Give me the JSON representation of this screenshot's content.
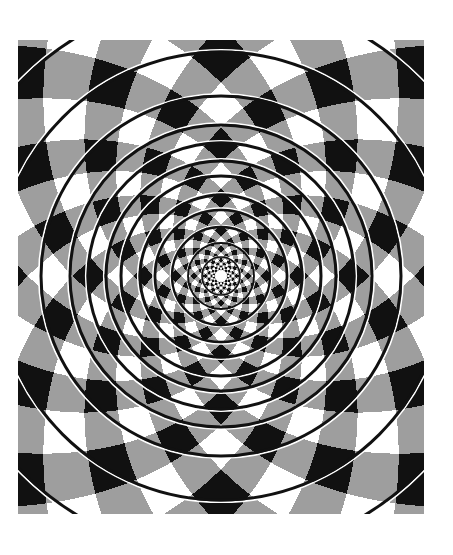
{
  "figure": {
    "title": "Fraser spiral illusion",
    "frame": {
      "x": 18,
      "y": 40,
      "width": 406,
      "height": 474
    },
    "center": {
      "x": 203,
      "y": 236
    },
    "colors": {
      "black": "#111111",
      "gray": "#9e9e9e",
      "white": "#ffffff",
      "page_background": "#ffffff"
    },
    "pattern": {
      "type": "log-polar checker",
      "spokes": 24,
      "radial_frequency": 3.8,
      "twist_offset": 0.0
    },
    "center_dot": {
      "radius": 6,
      "color": "#ffffff"
    },
    "cord_circles": {
      "radii": [
        279,
        224,
        180,
        151,
        133,
        115,
        100,
        81,
        66,
        49,
        33,
        19
      ],
      "black_width": 3,
      "white_width": 1.6
    }
  }
}
